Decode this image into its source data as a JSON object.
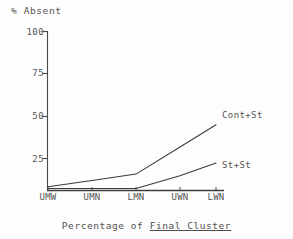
{
  "chart_data": {
    "type": "line",
    "title": "",
    "caption": "Percentage of Final Cluster",
    "caption_plain": "Percentage of ",
    "caption_underlined": "Final Cluster",
    "ylabel": "% Absent",
    "xlabel": "",
    "categories": [
      "UMW",
      "UMN",
      "LMN",
      "UWN",
      "LWN"
    ],
    "ylim": [
      0,
      100
    ],
    "yticks": [
      100,
      75,
      50,
      25
    ],
    "ytick_labels": [
      "100",
      "75",
      "50",
      "25"
    ],
    "grid": false,
    "legend_position": "right-inline",
    "series": [
      {
        "name": "Cont+St",
        "values": [
          2,
          6,
          10,
          27,
          41
        ],
        "color": "#3a3a3a"
      },
      {
        "name": "St+St",
        "values": [
          1,
          1,
          1,
          9,
          17
        ],
        "color": "#3a3a3a"
      }
    ],
    "annotations": [
      {
        "text": "Cont+St",
        "attached_to": "Cont+St",
        "at_category": "LWN"
      },
      {
        "text": "St+St",
        "attached_to": "St+St",
        "at_category": "LWN"
      }
    ]
  },
  "axis": {
    "line_color": "#444444",
    "tick_color": "#555555"
  }
}
